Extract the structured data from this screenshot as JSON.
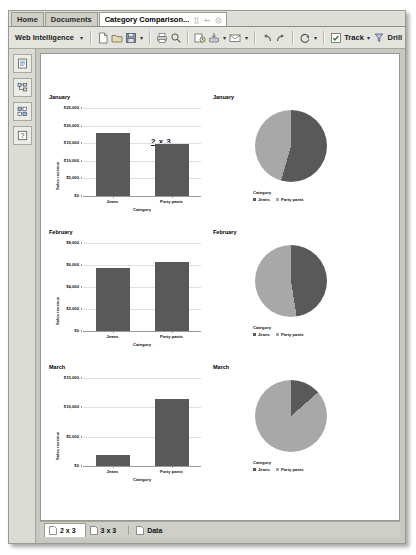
{
  "window": {
    "top_tabs": [
      {
        "label": "Home",
        "active": false
      },
      {
        "label": "Documents",
        "active": false
      }
    ],
    "document_tab": {
      "label": "Category Comparison...",
      "icons": [
        "pin-icon",
        "minimize-icon",
        "close-icon"
      ]
    }
  },
  "toolbar": {
    "app_menu_label": "Web Intelligence",
    "groups": [
      [
        "new-document-icon",
        "open-document-icon",
        "save-icon",
        "save-dropdown-caret"
      ],
      [
        "print-icon",
        "find-icon"
      ],
      [
        "history-icon",
        "export-icon",
        "export-dropdown-caret",
        "send-email-icon",
        "send-dropdown-caret"
      ],
      [
        "undo-icon",
        "redo-icon",
        "refresh-icon",
        "refresh-dropdown-caret"
      ]
    ],
    "track_label": "Track",
    "drill_label": "Drill"
  },
  "sidebar": {
    "items": [
      {
        "name": "document-summary-icon",
        "label": "Document Summary"
      },
      {
        "name": "navigation-map-icon",
        "label": "Navigation Map"
      },
      {
        "name": "input-controls-icon",
        "label": "Input Controls"
      },
      {
        "name": "web-services-icon",
        "label": "Web Services"
      }
    ]
  },
  "report": {
    "title": "2 x 3"
  },
  "bottom_tabs": [
    {
      "label": "2 x 3",
      "active": true
    },
    {
      "label": "3 x 3",
      "active": false
    },
    {
      "label": "Data",
      "active": false
    }
  ],
  "chart_data": [
    {
      "type": "bar",
      "title": "January",
      "categories": [
        "Jeans",
        "Party pants"
      ],
      "values": [
        17800,
        14900
      ],
      "xlabel": "Category",
      "ylabel": "Sales revenue",
      "ylim": [
        0,
        25000
      ],
      "yticks": [
        "$0",
        "$5,000",
        "$10,000",
        "$15,000",
        "$20,000",
        "$25,000"
      ],
      "grid": true,
      "legend": null
    },
    {
      "type": "pie",
      "title": "January",
      "categories": [
        "Jeans",
        "Party pants"
      ],
      "values": [
        17800,
        14900
      ],
      "legend_title": "Category",
      "legend_position": "bottom"
    },
    {
      "type": "bar",
      "title": "February",
      "categories": [
        "Jeans",
        "Party pants"
      ],
      "values": [
        5700,
        6300
      ],
      "xlabel": "Category",
      "ylabel": "Sales revenue",
      "ylim": [
        0,
        8000
      ],
      "yticks": [
        "$0",
        "$2,000",
        "$4,000",
        "$6,000",
        "$8,000"
      ],
      "grid": true,
      "legend": null
    },
    {
      "type": "pie",
      "title": "February",
      "categories": [
        "Jeans",
        "Party pants"
      ],
      "values": [
        5700,
        6300
      ],
      "legend_title": "Category",
      "legend_position": "bottom"
    },
    {
      "type": "bar",
      "title": "March",
      "categories": [
        "Jeans",
        "Party pants"
      ],
      "values": [
        1800,
        11500
      ],
      "xlabel": "Category",
      "ylabel": "Sales revenue",
      "ylim": [
        0,
        15000
      ],
      "yticks": [
        "$0",
        "$5,000",
        "$10,000",
        "$15,000"
      ],
      "grid": true,
      "legend": null
    },
    {
      "type": "pie",
      "title": "March",
      "categories": [
        "Jeans",
        "Party pants"
      ],
      "values": [
        1800,
        11500
      ],
      "legend_title": "Category",
      "legend_position": "bottom"
    }
  ],
  "colors": {
    "series_jeans": "#595959",
    "series_party_pants": "#a8a8a8",
    "page_bg": "#ffffff",
    "chrome_bg": "#e8e8e4"
  }
}
